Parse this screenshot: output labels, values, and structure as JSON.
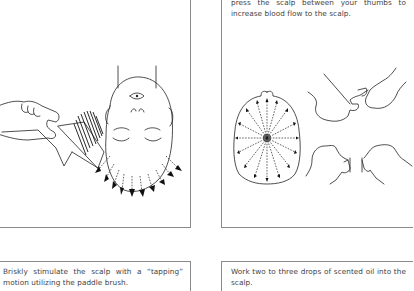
{
  "panels": {
    "top_left": {
      "illustration": "hand-holding-paddle-brush-on-upside-down-head",
      "text": ""
    },
    "top_right": {
      "text": "press the scalp between your thumbs to increase blood flow to the scalp.",
      "illustrations": [
        "scalp-top-view-radiating-arrows",
        "thumbs-pressing-scalp-upper",
        "thumbs-pressing-scalp-lower"
      ]
    },
    "bottom_left": {
      "text": "Briskly stimulate the scalp with a “tapping” motion utilizing the paddle brush."
    },
    "bottom_right": {
      "text": "Work two to three drops of scented oil into the scalp."
    }
  },
  "colors": {
    "border": "#8a8a8a",
    "text": "#444444",
    "line_art": "#222222",
    "background": "#ffffff"
  }
}
